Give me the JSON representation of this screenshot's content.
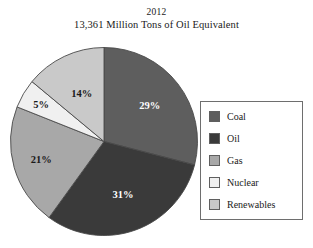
{
  "title": {
    "line1": "2012",
    "line2": "13,361 Million Tons of Oil Equivalent"
  },
  "legend": {
    "items": [
      {
        "label": "Coal",
        "color": "#5e5e5e"
      },
      {
        "label": "Oil",
        "color": "#3a3a3a"
      },
      {
        "label": "Gas",
        "color": "#a8a8a8"
      },
      {
        "label": "Nuclear",
        "color": "#f0f0f0"
      },
      {
        "label": "Renewables",
        "color": "#c9c9c9"
      }
    ]
  },
  "chart_data": {
    "type": "pie",
    "subtitle": "13,361 Million Tons of Oil Equivalent",
    "year": "2012",
    "total": "13,361 Million Tons of Oil Equivalent",
    "units": "percent of total",
    "legend_position": "right",
    "start_angle_deg": 0,
    "direction": "clockwise",
    "categories": [
      "Coal",
      "Oil",
      "Gas",
      "Nuclear",
      "Renewables"
    ],
    "values": [
      29,
      31,
      21,
      5,
      14
    ],
    "labels": [
      "29%",
      "31%",
      "21%",
      "5%",
      "14%"
    ],
    "colors": [
      "#5e5e5e",
      "#3a3a3a",
      "#a8a8a8",
      "#f0f0f0",
      "#c9c9c9"
    ],
    "label_text_colors": [
      "#ffffff",
      "#ffffff",
      "#1a1a1a",
      "#1a1a1a",
      "#1a1a1a"
    ],
    "slices": [
      {
        "name": "Coal",
        "value": 29,
        "label": "29%",
        "color": "#5e5e5e",
        "label_color": "#ffffff"
      },
      {
        "name": "Oil",
        "value": 31,
        "label": "31%",
        "color": "#3a3a3a",
        "label_color": "#ffffff"
      },
      {
        "name": "Gas",
        "value": 21,
        "label": "21%",
        "color": "#a8a8a8",
        "label_color": "#1a1a1a"
      },
      {
        "name": "Nuclear",
        "value": 5,
        "label": "5%",
        "color": "#f0f0f0",
        "label_color": "#1a1a1a"
      },
      {
        "name": "Renewables",
        "value": 14,
        "label": "14%",
        "color": "#c9c9c9",
        "label_color": "#1a1a1a"
      }
    ]
  }
}
